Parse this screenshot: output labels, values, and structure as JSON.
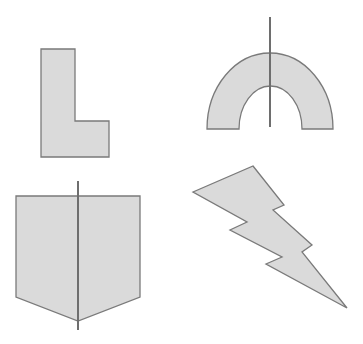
{
  "figure": {
    "colors": {
      "fill": "#dadada",
      "stroke": "#7a7a7a",
      "symmetry_line": "#6e6e6e",
      "background": "#ffffff"
    },
    "shapes": [
      {
        "id": "l-shape",
        "name": "L shape",
        "has_symmetry_line": false
      },
      {
        "id": "arch",
        "name": "Arch (half ring)",
        "has_symmetry_line": true
      },
      {
        "id": "pentagon",
        "name": "Pentagon (shield)",
        "has_symmetry_line": true
      },
      {
        "id": "lightning-bolt",
        "name": "Lightning bolt",
        "has_symmetry_line": false
      }
    ]
  }
}
